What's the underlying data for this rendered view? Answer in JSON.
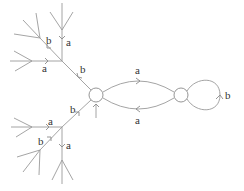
{
  "diagram": {
    "type": "graph-covering-tree",
    "nodes": [
      {
        "id": "left-vertex",
        "label": ""
      },
      {
        "id": "right-vertex",
        "label": ""
      }
    ],
    "edges": [
      {
        "id": "top-arc",
        "label": "a",
        "from": "left-vertex",
        "to": "right-vertex"
      },
      {
        "id": "bottom-arc",
        "label": "a",
        "from": "right-vertex",
        "to": "left-vertex"
      },
      {
        "id": "loop",
        "label": "b",
        "from": "right-vertex",
        "to": "right-vertex"
      },
      {
        "id": "upper-trunk",
        "label": "b"
      },
      {
        "id": "upper-vertical",
        "label": "a"
      },
      {
        "id": "upper-horizontal",
        "label": "a"
      },
      {
        "id": "upper-diagonal",
        "label": "b"
      },
      {
        "id": "lower-trunk",
        "label": "b"
      },
      {
        "id": "lower-horizontal",
        "label": "a"
      },
      {
        "id": "lower-diagonal",
        "label": "b"
      },
      {
        "id": "lower-vertical",
        "label": "a"
      }
    ],
    "start_marker": "base-point-arrow"
  }
}
